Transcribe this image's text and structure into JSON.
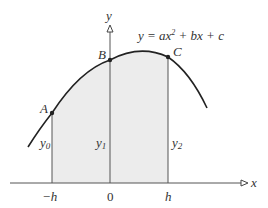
{
  "diagram": {
    "equation": "y = ax² + bx + c",
    "axes": {
      "x_label": "x",
      "y_label": "y"
    },
    "points": [
      {
        "name": "A",
        "label": "A"
      },
      {
        "name": "B",
        "label": "B"
      },
      {
        "name": "C",
        "label": "C"
      }
    ],
    "ordinates": [
      {
        "label": "y",
        "sub": "0"
      },
      {
        "label": "y",
        "sub": "1"
      },
      {
        "label": "y",
        "sub": "2"
      }
    ],
    "ticks": [
      "−h",
      "0",
      "h"
    ],
    "colors": {
      "curve": "#222222",
      "axes": "#555555",
      "fill": "#ececec"
    }
  }
}
